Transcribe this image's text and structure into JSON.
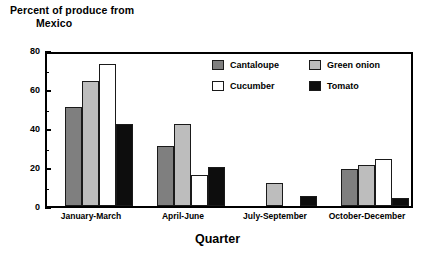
{
  "chart_data": {
    "type": "bar",
    "title": "Percent of produce from Mexico",
    "title_line1": "Percent of produce from",
    "title_line2": "Mexico",
    "xlabel": "Quarter",
    "ylabel": "",
    "ylim": [
      0,
      80
    ],
    "yticks": [
      0,
      20,
      40,
      60,
      80
    ],
    "yminorticks": [
      10,
      30,
      50,
      70
    ],
    "grid": false,
    "legend_position": "inside-top-right",
    "categories": [
      "January-March",
      "April-June",
      "July-September",
      "October-December"
    ],
    "series": [
      {
        "name": "Cantaloupe",
        "color": "#7f7f7f",
        "values": [
          51,
          31,
          0,
          19
        ]
      },
      {
        "name": "Green onion",
        "color": "#bdbdbd",
        "values": [
          64,
          42,
          12,
          21
        ]
      },
      {
        "name": "Cucumber",
        "color": "#ffffff",
        "values": [
          73,
          16,
          0,
          24
        ]
      },
      {
        "name": "Tomato",
        "color": "#0d0d0d",
        "values": [
          42,
          20,
          5,
          4
        ]
      }
    ]
  }
}
